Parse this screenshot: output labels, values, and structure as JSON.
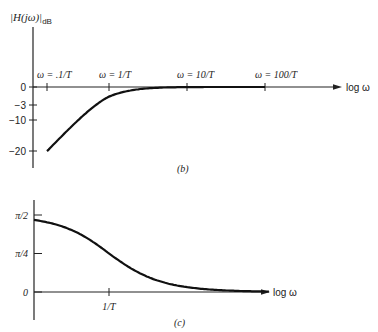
{
  "chart_data": [
    {
      "type": "line",
      "panel_label": "(b)",
      "title": "",
      "ylabel_main": "|H(jω)|",
      "ylabel_sub": "dB",
      "xlabel": "log ω",
      "x_scale": "log",
      "xlim_decades": [
        -1.2,
        2.8
      ],
      "ylim": [
        -26,
        24
      ],
      "x_ticks": [
        {
          "value": -1,
          "label": "ω = .1/T"
        },
        {
          "value": 0,
          "label": "ω = 1/T"
        },
        {
          "value": 1,
          "label": "ω = 10/T"
        },
        {
          "value": 2,
          "label": "ω = 100/T"
        }
      ],
      "y_ticks": [
        {
          "value": 0,
          "label": "0"
        },
        {
          "value": -3,
          "label": "−3"
        },
        {
          "value": -10,
          "label": "−10"
        },
        {
          "value": -20,
          "label": "−20"
        }
      ],
      "series": [
        {
          "name": "magnitude",
          "function": "highpass_dB",
          "x_range_decades": [
            -1,
            2
          ]
        }
      ],
      "grid": false
    },
    {
      "type": "line",
      "panel_label": "(c)",
      "title": "",
      "ylabel_main": "",
      "xlabel": "log ω",
      "x_scale": "log",
      "xlim_decades": [
        -1.2,
        2.8
      ],
      "ylim": [
        -0.4,
        1.8
      ],
      "x_ticks": [
        {
          "value": 0,
          "label": "1/T"
        }
      ],
      "y_ticks": [
        {
          "value": 1.5708,
          "label": "π/2"
        },
        {
          "value": 0.7854,
          "label": "π/4"
        },
        {
          "value": 0,
          "label": "0"
        }
      ],
      "series": [
        {
          "name": "phase",
          "function": "highpass_phase",
          "x_range_decades": [
            -1.2,
            2.1
          ]
        }
      ],
      "grid": false
    }
  ]
}
